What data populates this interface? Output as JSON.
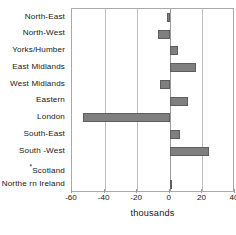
{
  "chart_data": {
    "type": "bar",
    "orientation": "horizontal",
    "title": "",
    "subtitle": "",
    "xlabel": "thousands",
    "ylabel": "",
    "categories": [
      "North-East",
      "North-West",
      "Yorks/Humber",
      "East  Midlands",
      "West  Midlands",
      "Eastern",
      "London",
      "South-East",
      "South -West",
      "*Scotland",
      "Northe rn Ireland"
    ],
    "values": [
      -1.5,
      -7,
      5,
      16,
      -6,
      11,
      -53,
      6,
      24,
      0,
      1
    ],
    "xticks": [
      -60,
      -40,
      -20,
      0,
      20,
      40
    ],
    "xlim": [
      -60,
      40
    ],
    "grid": true,
    "legend": false,
    "bar_color": "#7f7f7f",
    "bar_edge_color": "#5e5e5e",
    "plot_border_color": "#a9a9a9",
    "gridline_color": "#bdbdbd",
    "zeroline_color": "#9a9a9a",
    "background_color": "#ffffff",
    "text_color": "#161616",
    "annotations": [
      {
        "text": "*",
        "attached_to": "Scotland",
        "meaning": "footnote marker on Scotland category label"
      }
    ]
  }
}
